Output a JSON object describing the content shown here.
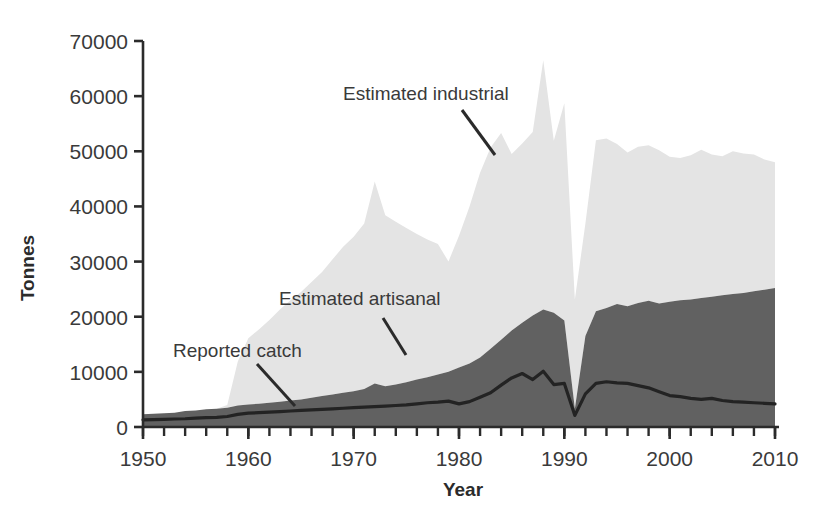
{
  "chart_data": {
    "type": "area",
    "title": "",
    "xlabel": "Year",
    "ylabel": "Tonnes",
    "xlim": [
      1950,
      2010
    ],
    "ylim": [
      0,
      70000
    ],
    "xticks": [
      1950,
      1960,
      1970,
      1980,
      1990,
      2000,
      2010
    ],
    "yticks": [
      0,
      10000,
      20000,
      30000,
      40000,
      50000,
      60000,
      70000
    ],
    "minor_xtick_interval": 2,
    "grid": false,
    "legend_position": "inline-annotations",
    "stacked": true,
    "x": [
      1950,
      1951,
      1952,
      1953,
      1954,
      1955,
      1956,
      1957,
      1958,
      1959,
      1960,
      1961,
      1962,
      1963,
      1964,
      1965,
      1966,
      1967,
      1968,
      1969,
      1970,
      1971,
      1972,
      1973,
      1974,
      1975,
      1976,
      1977,
      1978,
      1979,
      1980,
      1981,
      1982,
      1983,
      1984,
      1985,
      1986,
      1987,
      1988,
      1989,
      1990,
      1991,
      1992,
      1993,
      1994,
      1995,
      1996,
      1997,
      1998,
      1999,
      2000,
      2001,
      2002,
      2003,
      2004,
      2005,
      2006,
      2007,
      2008,
      2009,
      2010
    ],
    "series": [
      {
        "name": "Estimated artisanal",
        "color": "#616161",
        "note": "dark grey band, stacked from zero",
        "values": [
          2300,
          2400,
          2500,
          2600,
          2900,
          3000,
          3200,
          3300,
          3500,
          3900,
          4100,
          4200,
          4400,
          4600,
          4800,
          5000,
          5300,
          5600,
          5900,
          6200,
          6500,
          6900,
          7900,
          7400,
          7700,
          8100,
          8600,
          9000,
          9500,
          10000,
          10800,
          11500,
          12600,
          14200,
          15800,
          17500,
          18900,
          20200,
          21300,
          20700,
          19300,
          3300,
          16500,
          21000,
          21600,
          22300,
          21900,
          22500,
          22900,
          22400,
          22700,
          23000,
          23100,
          23400,
          23600,
          23900,
          24100,
          24300,
          24600,
          24900,
          25200
        ]
      },
      {
        "name": "Estimated industrial",
        "color": "#e4e4e4",
        "note": "light grey band, stacked on top of artisanal; values are the increment above artisanal",
        "values": [
          0,
          0,
          0,
          0,
          0,
          0,
          0,
          0,
          500,
          8000,
          12000,
          13500,
          15000,
          16700,
          18200,
          19500,
          21000,
          22500,
          24500,
          26500,
          28000,
          30000,
          36600,
          31000,
          29500,
          28000,
          26400,
          25000,
          23700,
          20000,
          23900,
          28500,
          33500,
          36500,
          37500,
          32000,
          32500,
          33300,
          45200,
          31200,
          39400,
          19800,
          20400,
          31000,
          30700,
          29000,
          27900,
          28300,
          28200,
          27800,
          26300,
          25800,
          26200,
          26900,
          25800,
          25200,
          25900,
          25300,
          24800,
          23600,
          22800
        ]
      }
    ],
    "line_series": {
      "name": "Reported catch",
      "color": "#232323",
      "values": [
        1300,
        1350,
        1400,
        1450,
        1500,
        1600,
        1700,
        1750,
        1900,
        2300,
        2500,
        2600,
        2700,
        2800,
        2900,
        3000,
        3100,
        3200,
        3300,
        3400,
        3500,
        3600,
        3700,
        3800,
        3900,
        4000,
        4200,
        4400,
        4500,
        4700,
        4200,
        4600,
        5400,
        6200,
        7600,
        8900,
        9700,
        8600,
        10100,
        7700,
        7900,
        2100,
        6000,
        7900,
        8200,
        8000,
        7900,
        7500,
        7100,
        6400,
        5700,
        5500,
        5200,
        5000,
        5200,
        4800,
        4600,
        4500,
        4400,
        4300,
        4200
      ]
    },
    "annotations": [
      {
        "id": "reported-catch",
        "label": "Reported catch",
        "text_x": 173,
        "text_y": 357,
        "leader": {
          "x1": 257,
          "y1": 364,
          "x2": 295,
          "y2": 406
        }
      },
      {
        "id": "estimated-artisanal",
        "label": "Estimated artisanal",
        "text_x": 279,
        "text_y": 305,
        "leader": {
          "x1": 383,
          "y1": 318,
          "x2": 406,
          "y2": 355
        }
      },
      {
        "id": "estimated-industrial",
        "label": "Estimated industrial",
        "text_x": 343,
        "text_y": 100,
        "leader": {
          "x1": 462,
          "y1": 110,
          "x2": 495,
          "y2": 155
        }
      }
    ]
  },
  "axes": {
    "ylabel": "Tonnes",
    "xlabel": "Year",
    "ytick_labels": [
      "0",
      "10000",
      "20000",
      "30000",
      "40000",
      "50000",
      "60000",
      "70000"
    ],
    "xtick_labels": [
      "1950",
      "1960",
      "1970",
      "1980",
      "1990",
      "2000",
      "2010"
    ]
  },
  "colors": {
    "industrial": "#e4e4e4",
    "artisanal": "#616161",
    "reported_line": "#232323",
    "axis": "#2b2b2b",
    "background": "#ffffff"
  }
}
